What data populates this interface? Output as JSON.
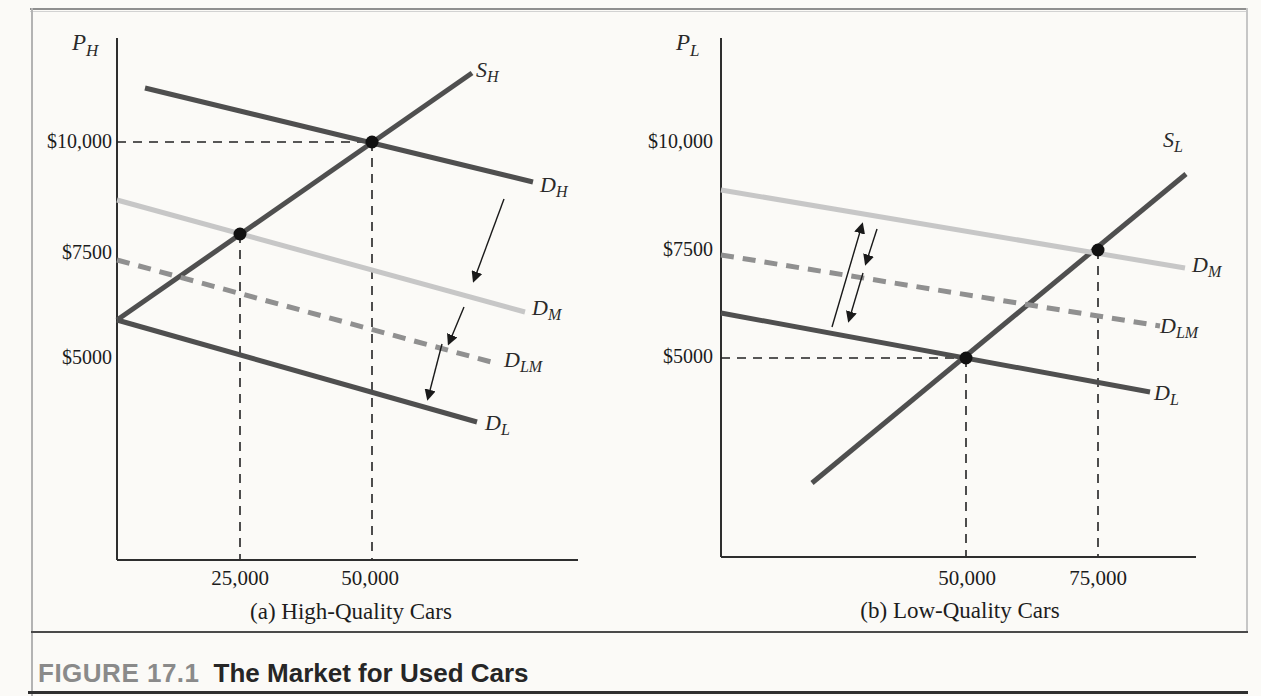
{
  "figure": {
    "label": "FIGURE 17.1",
    "title": "The Market for Used Cars"
  },
  "colors": {
    "dark_curve": "#4f4f4f",
    "medium_demand": "#c7c7c7",
    "lemon_medium_demand": "#909090",
    "guide": "#222222",
    "axis": "#2e2e2e",
    "dot": "#111111",
    "arrow": "#1a1a1a"
  },
  "chart_data": [
    {
      "type": "line",
      "panel": "a",
      "caption": "(a) High-Quality Cars",
      "y_axis_label": {
        "base": "P",
        "sub": "H"
      },
      "y_ticks": [
        {
          "label": "$10,000",
          "value": 10000,
          "px": {
            "x": 112,
            "y": 142
          }
        },
        {
          "label": "$7500",
          "value": 7500,
          "px": {
            "x": 112,
            "y": 253
          }
        },
        {
          "label": "$5000",
          "value": 5000,
          "px": {
            "x": 112,
            "y": 358
          }
        }
      ],
      "x_ticks": [
        {
          "label": "25,000",
          "value": 25000,
          "px": {
            "x": 240,
            "y": 566
          }
        },
        {
          "label": "50,000",
          "value": 50000,
          "px": {
            "x": 370,
            "y": 566
          }
        }
      ],
      "axes_px": {
        "origin": {
          "x": 117,
          "y": 560
        },
        "y_top": 38,
        "x_right": 578
      },
      "curves": [
        {
          "id": "SH",
          "label": {
            "base": "S",
            "sub": "H"
          },
          "role": "supply",
          "color": "#4f4f4f",
          "width": 5,
          "dash": null,
          "points_px": [
            [
              117,
              320
            ],
            [
              472,
              73
            ]
          ],
          "label_px": {
            "x": 476,
            "y": 57
          }
        },
        {
          "id": "DH",
          "label": {
            "base": "D",
            "sub": "H"
          },
          "role": "demand-high-quality",
          "color": "#4f4f4f",
          "width": 5,
          "dash": null,
          "points_px": [
            [
              145,
              88
            ],
            [
              533,
              182
            ]
          ],
          "label_px": {
            "x": 540,
            "y": 172
          }
        },
        {
          "id": "DM",
          "label": {
            "base": "D",
            "sub": "M"
          },
          "role": "demand-medium",
          "color": "#c7c7c7",
          "width": 5,
          "dash": null,
          "points_px": [
            [
              117,
              200
            ],
            [
              525,
              312
            ]
          ],
          "label_px": {
            "x": 532,
            "y": 295
          }
        },
        {
          "id": "DLM",
          "label": {
            "base": "D",
            "sub": "LM"
          },
          "role": "demand-lemons-medium",
          "color": "#909090",
          "width": 5,
          "dash": "13 9",
          "points_px": [
            [
              117,
              260
            ],
            [
              495,
              363
            ]
          ],
          "label_px": {
            "x": 504,
            "y": 347
          }
        },
        {
          "id": "DL",
          "label": {
            "base": "D",
            "sub": "L"
          },
          "role": "demand-low-quality",
          "color": "#4f4f4f",
          "width": 5,
          "dash": null,
          "points_px": [
            [
              117,
              320
            ],
            [
              477,
              422
            ]
          ],
          "label_px": {
            "x": 485,
            "y": 410
          }
        }
      ],
      "equilibria": [
        {
          "curves": "S_H x D_H",
          "quantity": 50000,
          "price": 10000,
          "px": {
            "x": 372,
            "y": 142
          }
        },
        {
          "curves": "S_H x D_M",
          "quantity": 25000,
          "price_approx": 7900,
          "px": {
            "x": 240,
            "y": 234
          }
        }
      ],
      "guides_px": [
        {
          "from": [
            117,
            142
          ],
          "to": [
            372,
            142
          ]
        },
        {
          "from": [
            372,
            142
          ],
          "to": [
            372,
            559
          ]
        },
        {
          "from": [
            240,
            234
          ],
          "to": [
            240,
            559
          ]
        }
      ],
      "arrows_px": [
        {
          "from": [
            504,
            199
          ],
          "to": [
            474,
            280
          ]
        },
        {
          "from": [
            464,
            307
          ],
          "to": [
            449,
            343
          ]
        },
        {
          "from": [
            442,
            344
          ],
          "to": [
            428,
            398
          ]
        }
      ]
    },
    {
      "type": "line",
      "panel": "b",
      "caption": "(b) Low-Quality Cars",
      "y_axis_label": {
        "base": "P",
        "sub": "L"
      },
      "y_ticks": [
        {
          "label": "$10,000",
          "value": 10000,
          "px": {
            "x": 713,
            "y": 142
          }
        },
        {
          "label": "$7500",
          "value": 7500,
          "px": {
            "x": 713,
            "y": 250
          }
        },
        {
          "label": "$5000",
          "value": 5000,
          "px": {
            "x": 713,
            "y": 357
          }
        }
      ],
      "x_ticks": [
        {
          "label": "50,000",
          "value": 50000,
          "px": {
            "x": 967,
            "y": 566
          }
        },
        {
          "label": "75,000",
          "value": 75000,
          "px": {
            "x": 1098,
            "y": 566
          }
        }
      ],
      "axes_px": {
        "origin": {
          "x": 721,
          "y": 557
        },
        "y_top": 38,
        "x_right": 1196
      },
      "curves": [
        {
          "id": "SL",
          "label": {
            "base": "S",
            "sub": "L"
          },
          "role": "supply",
          "color": "#4f4f4f",
          "width": 5,
          "dash": null,
          "points_px": [
            [
              812,
              483
            ],
            [
              1186,
              174
            ]
          ],
          "label_px": {
            "x": 1163,
            "y": 127
          }
        },
        {
          "id": "DM",
          "label": {
            "base": "D",
            "sub": "M"
          },
          "role": "demand-medium",
          "color": "#c7c7c7",
          "width": 5,
          "dash": null,
          "points_px": [
            [
              721,
              190
            ],
            [
              1185,
              268
            ]
          ],
          "label_px": {
            "x": 1192,
            "y": 252
          }
        },
        {
          "id": "DLM",
          "label": {
            "base": "D",
            "sub": "LM"
          },
          "role": "demand-lemons-medium",
          "color": "#909090",
          "width": 5,
          "dash": "13 9",
          "points_px": [
            [
              721,
              255
            ],
            [
              1160,
              326
            ]
          ],
          "label_px": {
            "x": 1160,
            "y": 313
          }
        },
        {
          "id": "DL",
          "label": {
            "base": "D",
            "sub": "L"
          },
          "role": "demand-low-quality",
          "color": "#4f4f4f",
          "width": 5,
          "dash": null,
          "points_px": [
            [
              721,
              313
            ],
            [
              1150,
              392
            ]
          ],
          "label_px": {
            "x": 1154,
            "y": 380
          }
        }
      ],
      "equilibria": [
        {
          "curves": "S_L x D_L",
          "quantity": 50000,
          "price": 5000,
          "px": {
            "x": 966,
            "y": 358
          }
        },
        {
          "curves": "S_L x D_M",
          "quantity": 75000,
          "price": 7500,
          "px": {
            "x": 1098,
            "y": 250
          }
        }
      ],
      "guides_px": [
        {
          "from": [
            721,
            358
          ],
          "to": [
            966,
            358
          ]
        },
        {
          "from": [
            966,
            358
          ],
          "to": [
            966,
            556
          ]
        },
        {
          "from": [
            1098,
            250
          ],
          "to": [
            1098,
            556
          ]
        }
      ],
      "arrows_px": [
        {
          "from": [
            832,
            327
          ],
          "to": [
            862,
            225
          ]
        },
        {
          "from": [
            877,
            229
          ],
          "to": [
            866,
            263
          ]
        },
        {
          "from": [
            863,
            273
          ],
          "to": [
            849,
            320
          ]
        }
      ]
    }
  ]
}
